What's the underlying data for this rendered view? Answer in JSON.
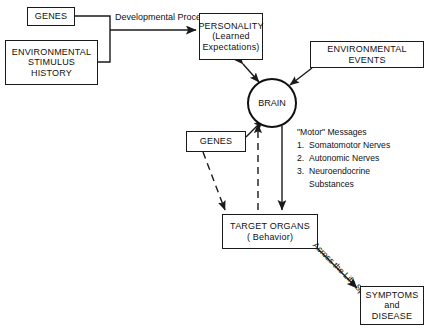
{
  "diagram": {
    "colors": {
      "background": "#ffffff",
      "stroke": "#1a1a1a",
      "text": "#111111"
    },
    "nodes": {
      "genes_top": {
        "lines": [
          "GENES"
        ]
      },
      "env_stimulus_history": {
        "lines": [
          "ENVIRONMENTAL",
          "STIMULUS",
          "HISTORY"
        ]
      },
      "personality": {
        "lines": [
          "PERSONALITY",
          "(Learned",
          "Expectations)"
        ]
      },
      "environmental_events": {
        "lines": [
          "ENVIRONMENTAL",
          "EVENTS"
        ]
      },
      "brain": {
        "lines": [
          "BRAIN"
        ]
      },
      "genes_mid": {
        "lines": [
          "GENES"
        ]
      },
      "target_organs": {
        "lines": [
          "TARGET ORGANS",
          "( Behavior)"
        ]
      },
      "symptoms_disease": {
        "lines": [
          "SYMPTOMS",
          "and",
          "DISEASE"
        ]
      }
    },
    "edge_labels": {
      "developmental_processes": {
        "line1": "Developmental",
        "line2": "Processes"
      },
      "across_the_life_span": {
        "line1": "Across the",
        "line2": "Life Span"
      }
    },
    "motor_messages": {
      "heading": "\"Motor\" Messages",
      "items": [
        {
          "num": "1.",
          "text": "Somatomotor Nerves"
        },
        {
          "num": "2.",
          "text": "Autonomic Nerves"
        },
        {
          "num": "3.",
          "text": "Neuroendocrine"
        },
        {
          "num": "",
          "text": "Substances",
          "continuation": true
        }
      ]
    }
  }
}
